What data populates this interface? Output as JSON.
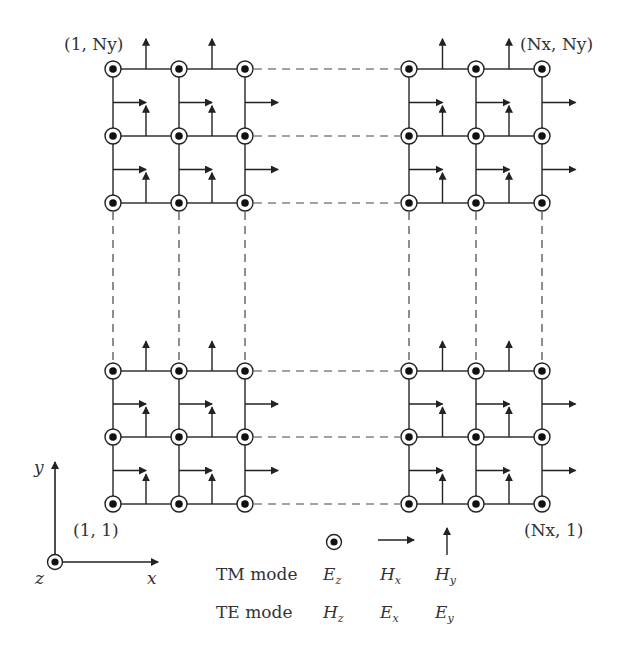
{
  "diagram": {
    "type": "yee-grid-2d",
    "corner_labels": {
      "top_left": "(1, Ny)",
      "top_right": "(Nx, Ny)",
      "bottom_left": "(1, 1)",
      "bottom_right": "(Nx, 1)"
    },
    "axes": {
      "x": "x",
      "y": "y",
      "z": "z"
    },
    "legend": {
      "symbols": [
        "circled-dot",
        "right-arrow",
        "up-arrow"
      ],
      "rows": [
        {
          "mode": "TM mode",
          "fields": [
            {
              "base": "E",
              "sub": "z"
            },
            {
              "base": "H",
              "sub": "x"
            },
            {
              "base": "H",
              "sub": "y"
            }
          ]
        },
        {
          "mode": "TE mode",
          "fields": [
            {
              "base": "H",
              "sub": "z"
            },
            {
              "base": "E",
              "sub": "x"
            },
            {
              "base": "E",
              "sub": "y"
            }
          ]
        }
      ]
    },
    "grid": {
      "cols_left": [
        113,
        179,
        245
      ],
      "cols_right": [
        409,
        476,
        542
      ],
      "rows_top": [
        69,
        136,
        203
      ],
      "rows_bottom": [
        371,
        437,
        504
      ]
    },
    "colors": {
      "ink": "#333333"
    }
  }
}
